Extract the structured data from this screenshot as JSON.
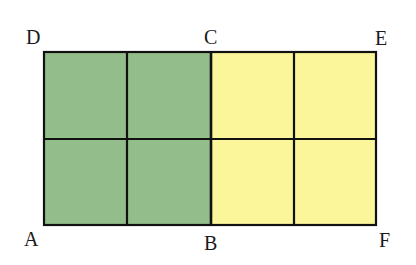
{
  "figure": {
    "colors": {
      "green": "#93bd8a",
      "yellow": "#fbf69a",
      "stroke": "#111111"
    },
    "labels": {
      "D": "D",
      "C": "C",
      "E": "E",
      "A": "A",
      "B": "B",
      "F": "F"
    },
    "grid": {
      "columns": 4,
      "rows": 2
    }
  }
}
